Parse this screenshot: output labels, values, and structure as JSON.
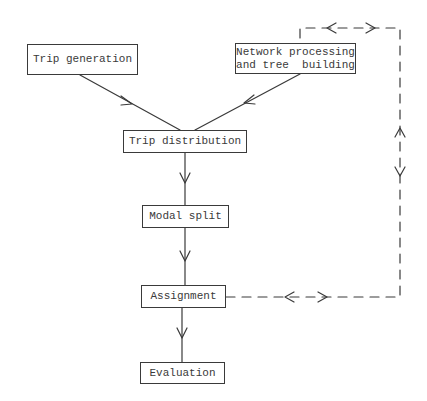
{
  "diagram": {
    "type": "flowchart",
    "nodes": [
      {
        "id": "trip_generation",
        "label": "Trip generation"
      },
      {
        "id": "network_processing",
        "label_line1": "Network processing",
        "label_line2": "and tree  building"
      },
      {
        "id": "trip_distribution",
        "label": "Trip distribution"
      },
      {
        "id": "modal_split",
        "label": "Modal split"
      },
      {
        "id": "assignment",
        "label": "Assignment"
      },
      {
        "id": "evaluation",
        "label": "Evaluation"
      }
    ],
    "edges": [
      {
        "from": "trip_generation",
        "to": "trip_distribution",
        "style": "solid"
      },
      {
        "from": "network_processing",
        "to": "trip_distribution",
        "style": "solid"
      },
      {
        "from": "trip_distribution",
        "to": "modal_split",
        "style": "solid"
      },
      {
        "from": "modal_split",
        "to": "assignment",
        "style": "solid"
      },
      {
        "from": "assignment",
        "to": "evaluation",
        "style": "solid"
      },
      {
        "from": "assignment",
        "to": "network_processing",
        "style": "dashed",
        "bidirectional": true
      }
    ],
    "colors": {
      "line": "#3a3a3a",
      "background": "#ffffff"
    }
  }
}
